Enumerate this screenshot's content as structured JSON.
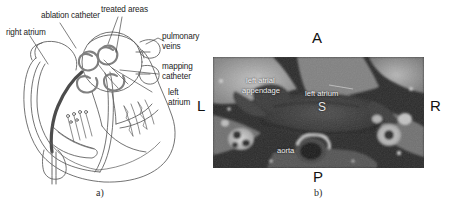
{
  "figure": {
    "panel_a": {
      "caption": "a)",
      "labels": [
        {
          "id": "ablation-catheter",
          "text": "ablation catheter"
        },
        {
          "id": "treated-areas",
          "text": "treated areas"
        },
        {
          "id": "right-atrium",
          "text": "right atrium"
        },
        {
          "id": "pulmonary-veins",
          "text": "pulmonary\nveins"
        },
        {
          "id": "pulmonary-veins-l1",
          "text": "pulmonary"
        },
        {
          "id": "pulmonary-veins-l2",
          "text": "veins"
        },
        {
          "id": "mapping-catheter-l1",
          "text": "mapping"
        },
        {
          "id": "mapping-catheter-l2",
          "text": "catheter"
        },
        {
          "id": "left-atrium-l1",
          "text": "left"
        },
        {
          "id": "left-atrium-l2",
          "text": "atrium"
        }
      ]
    },
    "panel_b": {
      "caption": "b)",
      "orientation": {
        "anterior": "A",
        "posterior": "P",
        "left": "L",
        "right": "R"
      },
      "annotations": [
        {
          "id": "left-atrial-appendage-l1",
          "text": "left atrial"
        },
        {
          "id": "left-atrial-appendage-l2",
          "text": "appendage"
        },
        {
          "id": "left-atrium",
          "text": "left atrium"
        },
        {
          "id": "aorta",
          "text": "aorta"
        },
        {
          "id": "superior-marker",
          "text": "S"
        }
      ]
    }
  },
  "colors": {
    "ink": "#1d1d1d",
    "diagram_stroke": "#4a4a4a",
    "catheter_dark": "#555555",
    "ct_dark": "#2a2a2a",
    "ct_light": "#b8b8b8",
    "ct_text": "#f2f2f2",
    "background": "#ffffff"
  }
}
